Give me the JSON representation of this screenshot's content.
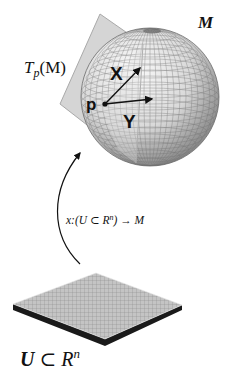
{
  "diagram": {
    "title_manifold": "M",
    "tangent_space_label": {
      "T": "T",
      "sub": "p",
      "arg": "(M)"
    },
    "point_label": "p",
    "vector_x_label": "X",
    "vector_y_label": "Y",
    "map_label": {
      "prefix": "x:(U ⊂ R",
      "sup": "n",
      "suffix": ") → M"
    },
    "domain_label": {
      "U": "U",
      "subset": " ⊂ R",
      "sup": "n"
    },
    "colors": {
      "sphere_light": "#f4f4f4",
      "sphere_dark": "#8a8a8a",
      "grid_line": "#6a6a6a",
      "plane_fill": "#d4d4d4",
      "plane_edge": "#9a9a9a",
      "plate_top": "#bdbdbd",
      "plate_edge": "#1a1a1a",
      "ink": "#111111"
    }
  }
}
